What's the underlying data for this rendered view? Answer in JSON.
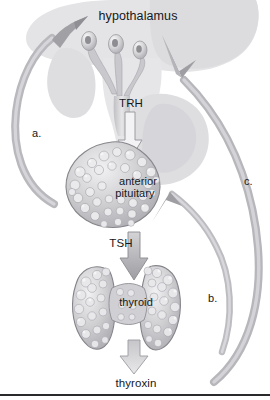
{
  "figure": {
    "style": "grayscale medical illustration"
  },
  "labels": {
    "hypothalamus": "hypothalamus",
    "trh": "TRH",
    "anterior_pituitary_line1": "anterior",
    "anterior_pituitary_line2": "pituitary",
    "tsh": "TSH",
    "thyroid": "thyroid",
    "thyroxin": "thyroxin",
    "feedback_a": "a.",
    "feedback_b": "b.",
    "feedback_c": "c."
  },
  "colors": {
    "background": "#ffffff",
    "silhouette": "#e3e3e5",
    "silhouette_deep": "#d5d5d8",
    "arrow_fill": "#b3b3b6",
    "arrow_stroke": "#8f8f93",
    "arrow_light": "#d9d9dc",
    "organ_fill": "#c5c5c8",
    "organ_stroke": "#8b8b8f",
    "organ_highlight": "#ededef",
    "text": "#16171a",
    "rule": "#2a2a2c"
  },
  "structures": [
    {
      "name": "hypothalamus",
      "type": "brain-region"
    },
    {
      "name": "neurosecretory-cells",
      "type": "neurons",
      "count": 3
    },
    {
      "name": "anterior-pituitary",
      "type": "gland"
    },
    {
      "name": "thyroid",
      "type": "gland"
    }
  ],
  "hormone_arrows": [
    {
      "name": "trh-arrow",
      "label": "TRH",
      "direction": "down",
      "from": "hypothalamus",
      "to": "anterior pituitary"
    },
    {
      "name": "tsh-arrow",
      "label": "TSH",
      "direction": "down",
      "from": "anterior pituitary",
      "to": "thyroid"
    },
    {
      "name": "thyroxin-arrow",
      "label": "thyroxin",
      "direction": "down",
      "from": "thyroid",
      "to": "thyroxin"
    }
  ],
  "feedback_arrows": [
    {
      "name": "feedback-arrow-a",
      "label": "a.",
      "side": "left",
      "direction": "up",
      "target": "hypothalamus"
    },
    {
      "name": "feedback-arrow-b",
      "label": "b.",
      "side": "right",
      "direction": "up",
      "target": "anterior pituitary"
    },
    {
      "name": "feedback-arrow-c",
      "label": "c.",
      "side": "right",
      "direction": "up",
      "target": "hypothalamus"
    }
  ]
}
